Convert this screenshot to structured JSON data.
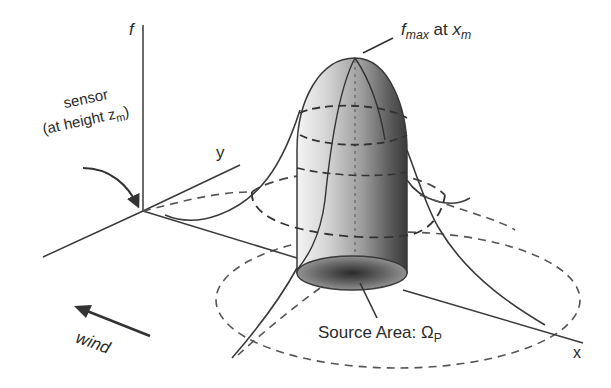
{
  "figure": {
    "type": "3D footprint / source-area schematic",
    "axes": {
      "vertical": "f",
      "horizontal_y": "y",
      "horizontal_x": "x"
    },
    "labels": {
      "peak": {
        "main": "f",
        "sub": "max",
        "mid": " at ",
        "var": "x",
        "var_sub": "m"
      },
      "sensor_line1": "sensor",
      "sensor_line2_prefix": "(at height ",
      "sensor_var": "z",
      "sensor_var_sub": "m",
      "sensor_line2_suffix": ")",
      "source_area_prefix": "Source Area: ",
      "source_area_symbol": "Ω",
      "source_area_sub": "P",
      "wind": "wind"
    },
    "colors": {
      "line": "#3a3a3a",
      "dash": "#4a4a4a",
      "cylinder_light": "#e8e8e8",
      "cylinder_dark": "#3c3c3c",
      "background": "#ffffff"
    }
  }
}
